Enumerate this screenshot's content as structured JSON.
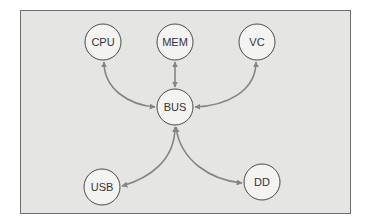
{
  "diagram": {
    "type": "bus-topology",
    "colors": {
      "background": "#ffffff",
      "frame_fill": "#e5e5e3",
      "frame_border": "#6e6e6e",
      "node_fill": "#f3f3f2",
      "node_stroke": "#4a4a4a",
      "edge": "#858585",
      "label": "#333333"
    },
    "nodes": [
      {
        "id": "cpu",
        "label": "CPU",
        "cx": 103,
        "cy": 42,
        "r": 18
      },
      {
        "id": "mem",
        "label": "MEM",
        "cx": 175,
        "cy": 42,
        "r": 18
      },
      {
        "id": "vc",
        "label": "VC",
        "cx": 257,
        "cy": 42,
        "r": 18
      },
      {
        "id": "bus",
        "label": "BUS",
        "cx": 175,
        "cy": 107,
        "r": 18
      },
      {
        "id": "usb",
        "label": "USB",
        "cx": 102,
        "cy": 187,
        "r": 18
      },
      {
        "id": "dd",
        "label": "DD",
        "cx": 262,
        "cy": 182,
        "r": 18
      }
    ],
    "edges": [
      {
        "from": "bus",
        "to": "cpu",
        "bidirectional": true
      },
      {
        "from": "bus",
        "to": "mem",
        "bidirectional": true
      },
      {
        "from": "bus",
        "to": "vc",
        "bidirectional": true
      },
      {
        "from": "bus",
        "to": "usb",
        "bidirectional": true
      },
      {
        "from": "bus",
        "to": "dd",
        "bidirectional": true
      }
    ]
  }
}
